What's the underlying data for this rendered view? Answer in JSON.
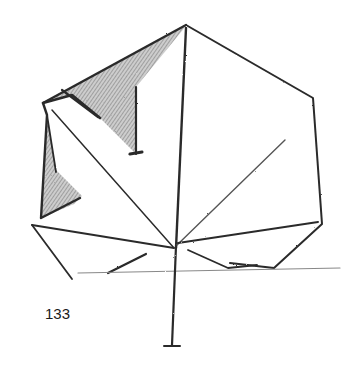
{
  "figure": {
    "number": "133",
    "stroke_color": "#2a2a2a",
    "shade_color": "#8a8a8a"
  }
}
